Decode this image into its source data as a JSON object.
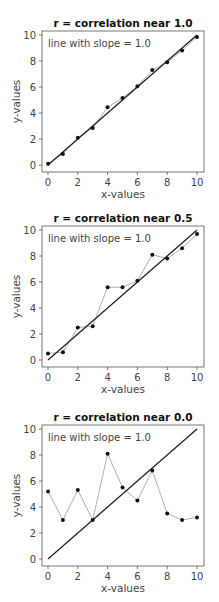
{
  "chart_data": [
    {
      "type": "line",
      "title": "r = correlation near 1.0",
      "xlabel": "x-values",
      "ylabel": "y-values",
      "annotation": "line with slope = 1.0",
      "xlim": [
        0,
        10
      ],
      "ylim": [
        0,
        10
      ],
      "xticks": [
        0,
        2,
        4,
        6,
        8,
        10
      ],
      "yticks": [
        0,
        2,
        4,
        6,
        8,
        10
      ],
      "grid": false,
      "series": [
        {
          "name": "data",
          "style": "points with thin connecting line",
          "x": [
            0,
            1,
            2,
            3,
            4,
            5,
            6,
            7,
            8,
            9,
            10
          ],
          "y": [
            0.1,
            0.85,
            2.1,
            2.85,
            4.45,
            5.15,
            6.05,
            7.3,
            7.9,
            8.8,
            9.85
          ]
        },
        {
          "name": "line with slope = 1.0",
          "style": "solid line",
          "x": [
            0,
            10
          ],
          "y": [
            0,
            10
          ]
        }
      ]
    },
    {
      "type": "line",
      "title": "r = correlation near 0.5",
      "xlabel": "x-values",
      "ylabel": "y-values",
      "annotation": "line with slope = 1.0",
      "xlim": [
        0,
        10
      ],
      "ylim": [
        0,
        10
      ],
      "xticks": [
        0,
        2,
        4,
        6,
        8,
        10
      ],
      "yticks": [
        0,
        2,
        4,
        6,
        8,
        10
      ],
      "grid": false,
      "series": [
        {
          "name": "data",
          "style": "points with thin connecting line",
          "x": [
            0,
            1,
            2,
            3,
            4,
            5,
            6,
            7,
            8,
            9,
            10
          ],
          "y": [
            0.5,
            0.6,
            2.5,
            2.6,
            5.6,
            5.6,
            6.1,
            8.1,
            7.8,
            8.6,
            9.7
          ]
        },
        {
          "name": "line with slope = 1.0",
          "style": "solid line",
          "x": [
            0,
            10
          ],
          "y": [
            0,
            10
          ]
        }
      ]
    },
    {
      "type": "line",
      "title": "r = correlation near 0.0",
      "xlabel": "x-values",
      "ylabel": "y-values",
      "annotation": "line with slope = 1.0",
      "xlim": [
        0,
        10
      ],
      "ylim": [
        0,
        10
      ],
      "xticks": [
        0,
        2,
        4,
        6,
        8,
        10
      ],
      "yticks": [
        0,
        2,
        4,
        6,
        8,
        10
      ],
      "grid": false,
      "series": [
        {
          "name": "data",
          "style": "points with thin connecting line",
          "x": [
            0,
            1,
            2,
            3,
            4,
            5,
            6,
            7,
            8,
            9,
            10
          ],
          "y": [
            5.2,
            3.0,
            5.3,
            3.0,
            8.1,
            5.5,
            4.5,
            6.8,
            3.5,
            3.0,
            3.2
          ]
        },
        {
          "name": "line with slope = 1.0",
          "style": "solid line",
          "x": [
            0,
            10
          ],
          "y": [
            0,
            10
          ]
        }
      ]
    }
  ],
  "colors": {
    "frame": "#555555",
    "data_line": "#9a9a9a",
    "points": "#111111",
    "slope_line": "#222222"
  }
}
